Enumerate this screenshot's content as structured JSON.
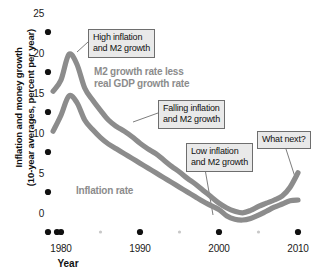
{
  "chart_data": {
    "type": "line",
    "title": "",
    "xlabel": "Year",
    "ylabel": "Inflation and money growth (10-year averages, percent per year)",
    "ylabel_line1": "Inflation and money growth",
    "ylabel_line2": "(10-year averages, percent per year)",
    "xlim": [
      1978,
      2011
    ],
    "ylim": [
      0,
      26
    ],
    "grid": false,
    "legend_position": "inline-annotations",
    "yticks": [
      0,
      5,
      10,
      15,
      20,
      25
    ],
    "ytick_labels": [
      "0",
      "5",
      "10",
      "15",
      "20",
      "25"
    ],
    "xticks": [
      1980,
      1990,
      2000,
      2010
    ],
    "xtick_labels": [
      "1980",
      "1990",
      "2000",
      "2010"
    ],
    "xminor_ticks": [
      1985,
      1995,
      2005
    ],
    "series": [
      {
        "name": "M2 growth rate less real GDP growth rate",
        "color": "#8c8c8c",
        "x": [
          1979,
          1980,
          1981,
          1982,
          1983,
          1984,
          1985,
          1986,
          1987,
          1988,
          1989,
          1990,
          1991,
          1992,
          1993,
          1994,
          1995,
          1996,
          1997,
          1998,
          1999,
          2000,
          2001,
          2002,
          2003,
          2004,
          2005,
          2006,
          2007,
          2008,
          2009,
          2010
        ],
        "values": [
          17.6,
          19.0,
          22.2,
          21.0,
          18.0,
          16.5,
          15.2,
          14.0,
          13.2,
          12.6,
          11.9,
          11.1,
          10.4,
          9.8,
          9.0,
          8.2,
          7.5,
          6.7,
          6.0,
          5.2,
          4.4,
          3.6,
          3.0,
          2.6,
          2.4,
          2.7,
          3.2,
          3.6,
          4.0,
          4.5,
          5.6,
          7.4
        ]
      },
      {
        "name": "Inflation rate",
        "color": "#8c8c8c",
        "x": [
          1979,
          1980,
          1981,
          1982,
          1983,
          1984,
          1985,
          1986,
          1987,
          1988,
          1989,
          1990,
          1991,
          1992,
          1993,
          1994,
          1995,
          1996,
          1997,
          1998,
          1999,
          2000,
          2001,
          2002,
          2003,
          2004,
          2005,
          2006,
          2007,
          2008,
          2009,
          2010
        ],
        "values": [
          12.6,
          14.6,
          17.0,
          16.2,
          14.0,
          12.8,
          11.8,
          11.0,
          10.4,
          9.8,
          9.2,
          8.6,
          8.0,
          7.4,
          6.8,
          6.2,
          5.6,
          5.0,
          4.4,
          3.8,
          3.3,
          2.8,
          2.0,
          1.6,
          1.5,
          1.7,
          2.1,
          2.6,
          3.1,
          3.5,
          3.9,
          4.0
        ]
      }
    ],
    "annotations": [
      {
        "id": "high-inflation",
        "text_line1": "High inflation",
        "text_line2": "and M2 growth",
        "box": {
          "left": 88,
          "top": 29,
          "width": 72,
          "height": 26
        },
        "leader": {
          "x1": 88,
          "y1": 42,
          "x2": 77,
          "y2": 52
        }
      },
      {
        "id": "falling-inflation",
        "text_line1": "Falling inflation",
        "text_line2": "and M2 growth",
        "box": {
          "left": 158,
          "top": 100,
          "width": 74,
          "height": 26
        },
        "leader": {
          "x1": 158,
          "y1": 113,
          "x2": 133,
          "y2": 122
        }
      },
      {
        "id": "low-inflation",
        "text_line1": "Low inflation",
        "text_line2": "and M2 growth",
        "box": {
          "left": 186,
          "top": 143,
          "width": 73,
          "height": 26
        },
        "leader": {
          "x1": 205,
          "y1": 169,
          "x2": 213,
          "y2": 215
        }
      },
      {
        "id": "what-next",
        "text_line1": "What next?",
        "text_line2": "",
        "box": {
          "left": 257,
          "top": 131,
          "width": 55,
          "height": 15
        },
        "leader": {
          "x1": 285,
          "y1": 146,
          "x2": 296,
          "y2": 180
        }
      }
    ],
    "series_labels": [
      {
        "id": "m2-growth-label",
        "text_line1": "M2 growth rate less",
        "text_line2": "real GDP growth rate",
        "left": 94,
        "top": 66
      },
      {
        "id": "inflation-rate-label",
        "text_line1": "Inflation rate",
        "text_line2": "",
        "left": 76,
        "top": 185
      }
    ],
    "colors": {
      "line": "#8c8c8c",
      "tick_dot": "#111111",
      "minor_tick_dot": "#c8c8c8",
      "callout_bg": "#e9e9e9",
      "callout_border": "#6e6e6e",
      "text": "#111111"
    }
  }
}
